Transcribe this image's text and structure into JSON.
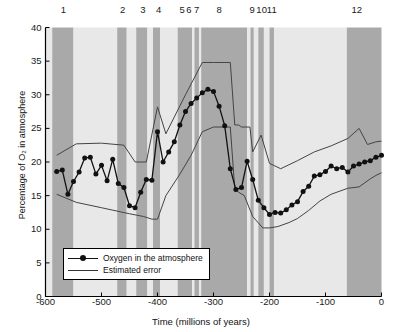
{
  "figure": {
    "background": "#ffffff",
    "band_color_dark": "#a9a9a9",
    "band_color_light": "#e8e8e8",
    "line_color": "#111111",
    "error_color": "#444444"
  },
  "axes": {
    "x_title": "Time (millions of years)",
    "y_title": "Percentage of O₂ in atmosphere",
    "x_ticks": [
      "-600",
      "-500",
      "-400",
      "-300",
      "-200",
      "-100",
      "0"
    ],
    "x_tick_values": [
      -600,
      -500,
      -400,
      -300,
      -200,
      -100,
      0
    ],
    "y_ticks": [
      "0",
      "5",
      "10",
      "15",
      "20",
      "25",
      "30",
      "35",
      "40"
    ],
    "y_tick_values": [
      0,
      5,
      10,
      15,
      20,
      25,
      30,
      35,
      40
    ],
    "xlim": [
      -600,
      0
    ],
    "ylim": [
      0,
      40
    ],
    "grid": false
  },
  "band_labels": [
    "1",
    "2",
    "3",
    "4",
    "5",
    "6",
    "7",
    "8",
    "9",
    "10",
    "11",
    "12"
  ],
  "band_label_x": [
    -568,
    -462,
    -426,
    -398,
    -356,
    -344,
    -330,
    -290,
    -231,
    -214,
    -196,
    -44
  ],
  "legend": {
    "position": "bottom-left-inside",
    "items": [
      {
        "label": "Oxygen in the atmosphere",
        "marker": "line-with-dot"
      },
      {
        "label": "Estimated error",
        "marker": "line"
      }
    ]
  },
  "chart_data": {
    "type": "line",
    "title": "",
    "xlabel": "Time (millions of years)",
    "ylabel": "Percentage of O₂ in atmosphere",
    "xlim": [
      -600,
      0
    ],
    "ylim": [
      0,
      40
    ],
    "grid": false,
    "series": [
      {
        "name": "Oxygen in the atmosphere",
        "marker": "circle",
        "x": [
          -580,
          -570,
          -560,
          -550,
          -540,
          -530,
          -520,
          -510,
          -500,
          -490,
          -480,
          -470,
          -460,
          -450,
          -440,
          -430,
          -420,
          -410,
          -400,
          -390,
          -380,
          -370,
          -360,
          -350,
          -340,
          -330,
          -320,
          -310,
          -300,
          -290,
          -280,
          -270,
          -260,
          -250,
          -240,
          -230,
          -220,
          -210,
          -200,
          -190,
          -180,
          -170,
          -160,
          -150,
          -140,
          -130,
          -120,
          -110,
          -100,
          -90,
          -80,
          -70,
          -60,
          -50,
          -40,
          -30,
          -20,
          -10,
          0
        ],
        "y": [
          18.6,
          18.8,
          15.2,
          17.1,
          18.5,
          20.6,
          20.7,
          18.2,
          19.5,
          17.2,
          20.4,
          16.8,
          16.2,
          13.5,
          13.2,
          15.5,
          17.4,
          17.3,
          24.5,
          20.0,
          21.5,
          23.0,
          25.5,
          27.5,
          28.7,
          29.5,
          30.3,
          30.8,
          30.5,
          28.3,
          25.4,
          19.0,
          15.9,
          16.2,
          20.1,
          17.4,
          14.3,
          13.2,
          12.2,
          12.5,
          12.4,
          12.9,
          13.6,
          14.1,
          15.6,
          16.4,
          17.9,
          18.1,
          18.6,
          19.4,
          19.0,
          19.2,
          18.5,
          19.4,
          19.7,
          20.0,
          20.2,
          20.7,
          21.0
        ]
      },
      {
        "name": "Estimated error upper",
        "marker": "none",
        "x": [
          -580,
          -545,
          -500,
          -460,
          -440,
          -420,
          -400,
          -385,
          -350,
          -320,
          -300,
          -270,
          -262,
          -255,
          -250,
          -235,
          -230,
          -215,
          -200,
          -180,
          -150,
          -120,
          -90,
          -60,
          -40,
          -25,
          -10,
          0
        ],
        "y": [
          21.0,
          22.7,
          22.8,
          22.5,
          20.0,
          20.0,
          28.2,
          24.2,
          30.0,
          34.8,
          34.8,
          34.8,
          25.5,
          25.5,
          25.2,
          25.2,
          21.5,
          24.0,
          19.8,
          19.0,
          20.2,
          21.5,
          22.4,
          23.5,
          25.0,
          22.6,
          23.0,
          23.1
        ]
      },
      {
        "name": "Estimated error lower",
        "marker": "none",
        "x": [
          -580,
          -545,
          -500,
          -450,
          -425,
          -410,
          -400,
          -385,
          -360,
          -340,
          -320,
          -300,
          -270,
          -262,
          -255,
          -245,
          -230,
          -212,
          -200,
          -185,
          -165,
          -150,
          -130,
          -110,
          -90,
          -60,
          -40,
          -20,
          -10,
          0
        ],
        "y": [
          15.2,
          14.0,
          13.2,
          12.3,
          11.9,
          11.5,
          11.5,
          15.0,
          18.2,
          21.0,
          24.5,
          25.2,
          25.2,
          16.0,
          15.5,
          15.0,
          11.9,
          10.2,
          10.2,
          10.4,
          11.0,
          11.6,
          12.8,
          14.2,
          15.2,
          16.1,
          16.3,
          17.5,
          18.0,
          18.4
        ]
      }
    ]
  },
  "bands": [
    {
      "x0": -600,
      "x1": -588,
      "shade": "light"
    },
    {
      "x0": -588,
      "x1": -550,
      "shade": "dark"
    },
    {
      "x0": -550,
      "x1": -472,
      "shade": "light"
    },
    {
      "x0": -472,
      "x1": -455,
      "shade": "dark"
    },
    {
      "x0": -455,
      "x1": -438,
      "shade": "light"
    },
    {
      "x0": -438,
      "x1": -418,
      "shade": "dark"
    },
    {
      "x0": -418,
      "x1": -408,
      "shade": "light"
    },
    {
      "x0": -408,
      "x1": -395,
      "shade": "dark"
    },
    {
      "x0": -395,
      "x1": -364,
      "shade": "light"
    },
    {
      "x0": -364,
      "x1": -338,
      "shade": "dark"
    },
    {
      "x0": -338,
      "x1": -334,
      "shade": "light"
    },
    {
      "x0": -334,
      "x1": -326,
      "shade": "dark"
    },
    {
      "x0": -326,
      "x1": -322,
      "shade": "light"
    },
    {
      "x0": -322,
      "x1": -240,
      "shade": "dark"
    },
    {
      "x0": -240,
      "x1": -234,
      "shade": "light"
    },
    {
      "x0": -234,
      "x1": -228,
      "shade": "dark"
    },
    {
      "x0": -228,
      "x1": -220,
      "shade": "light"
    },
    {
      "x0": -220,
      "x1": -210,
      "shade": "dark"
    },
    {
      "x0": -210,
      "x1": -200,
      "shade": "light"
    },
    {
      "x0": -200,
      "x1": -192,
      "shade": "dark"
    },
    {
      "x0": -192,
      "x1": -62,
      "shade": "light"
    },
    {
      "x0": -62,
      "x1": 0,
      "shade": "dark"
    }
  ]
}
